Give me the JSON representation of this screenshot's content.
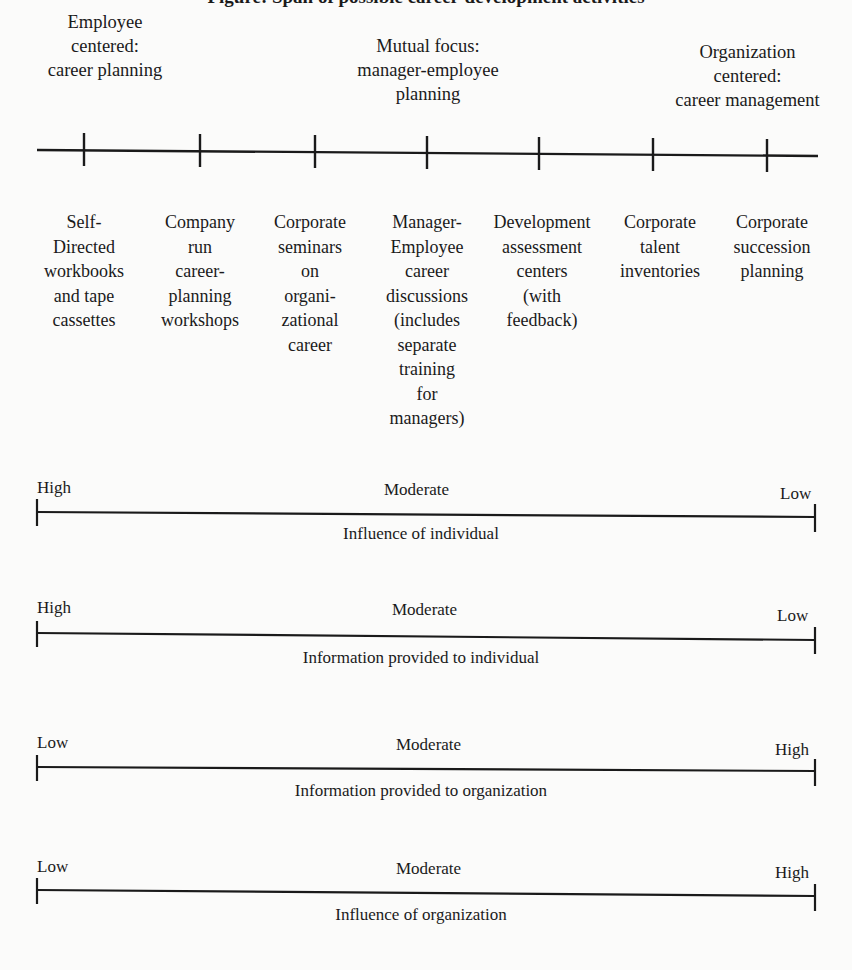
{
  "title": "Figure: Span of possible career-development activities",
  "zones": [
    {
      "lines": [
        "Employee",
        "centered:",
        "career planning"
      ]
    },
    {
      "lines": [
        "Mutual focus:",
        "manager-employee",
        "planning"
      ]
    },
    {
      "lines": [
        "Organization",
        "centered:",
        "career management"
      ]
    }
  ],
  "activities": [
    {
      "lines": [
        "Self-",
        "Directed",
        "workbooks",
        "and tape",
        "cassettes"
      ]
    },
    {
      "lines": [
        "Company",
        "run",
        "career-",
        "planning",
        "workshops"
      ]
    },
    {
      "lines": [
        "Corporate",
        "seminars",
        "on",
        "organi-",
        "zational",
        "career"
      ]
    },
    {
      "lines": [
        "Manager-",
        "Employee",
        "career",
        "discussions",
        "(includes",
        "separate",
        "training",
        "for",
        "managers)"
      ]
    },
    {
      "lines": [
        "Development",
        "assessment",
        "centers",
        "(with",
        "feedback)"
      ]
    },
    {
      "lines": [
        "Corporate",
        "talent",
        "inventories"
      ]
    },
    {
      "lines": [
        "Corporate",
        "succession",
        "planning"
      ]
    }
  ],
  "scales": [
    {
      "left": "High",
      "middle": "Moderate",
      "right": "Low",
      "caption": "Influence of individual"
    },
    {
      "left": "High",
      "middle": "Moderate",
      "right": "Low",
      "caption": "Information provided to individual"
    },
    {
      "left": "Low",
      "middle": "Moderate",
      "right": "High",
      "caption": "Information provided to organization"
    },
    {
      "left": "Low",
      "middle": "Moderate",
      "right": "High",
      "caption": "Influence of organization"
    }
  ]
}
